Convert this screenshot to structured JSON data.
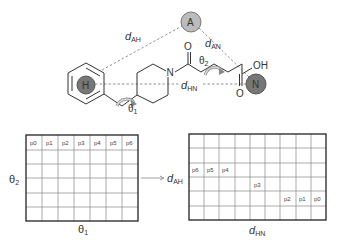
{
  "molecule": {
    "atoms": {
      "A": "A",
      "H": "H",
      "N_pharm": "N",
      "N_ring": "N",
      "O_top": "O",
      "OH": "OH",
      "O_bottom": "O"
    },
    "distance_labels": {
      "d_AH": {
        "main": "d",
        "sub": "AH"
      },
      "d_AN": {
        "main": "d",
        "sub": "AN"
      },
      "d_HN": {
        "main": "d",
        "sub": "HN"
      }
    },
    "angle_labels": {
      "theta1": {
        "main": "θ",
        "sub": "1"
      },
      "theta2": {
        "main": "θ",
        "sub": "2"
      }
    },
    "colors": {
      "pharmacophore_light": "#b8b8b8",
      "pharmacophore_dark": "#7a7a7a",
      "bond": "#333333",
      "dashed": "#777777",
      "rotation_arrow": "#999999"
    }
  },
  "left_grid": {
    "x_axis_label": {
      "main": "θ",
      "sub": "1"
    },
    "y_axis_label": {
      "main": "θ",
      "sub": "2"
    },
    "rows": 6,
    "cols": 7,
    "first_row_cells": [
      "p0",
      "p1",
      "p2",
      "p3",
      "p4",
      "p5",
      "p6"
    ]
  },
  "right_grid": {
    "x_axis_label": {
      "main": "d",
      "sub": "HN"
    },
    "y_axis_label": {
      "main": "d",
      "sub": "AH"
    },
    "rows": 6,
    "cols": 9,
    "cells": [
      {
        "row": 2,
        "col": 0,
        "label": "p6"
      },
      {
        "row": 2,
        "col": 1,
        "label": "p5"
      },
      {
        "row": 2,
        "col": 2,
        "label": "p4"
      },
      {
        "row": 3,
        "col": 4,
        "label": "p3"
      },
      {
        "row": 4,
        "col": 6,
        "label": "p2"
      },
      {
        "row": 4,
        "col": 7,
        "label": "p1"
      },
      {
        "row": 4,
        "col": 8,
        "label": "p0"
      }
    ]
  },
  "arrow": {
    "from": "left_grid",
    "to": "right_grid"
  }
}
